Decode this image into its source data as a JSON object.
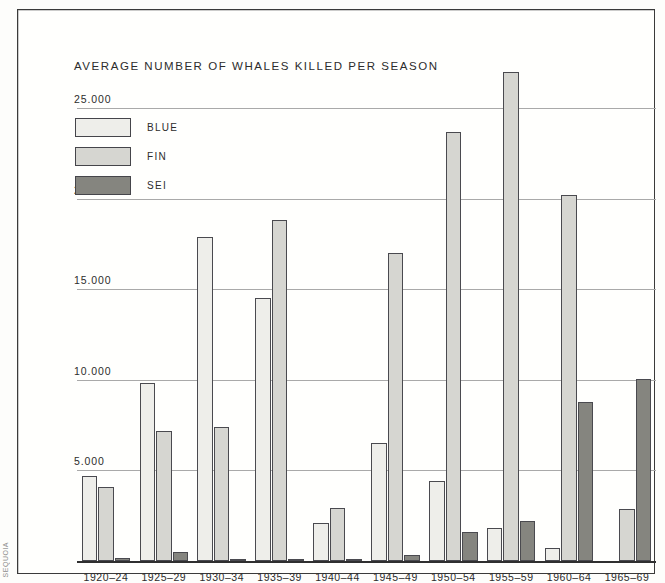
{
  "figure": {
    "title": "AVERAGE NUMBER OF WHALES KILLED PER SEASON",
    "spine_caption": "SEQUOIA"
  },
  "colors": {
    "blue": "#eeeeea",
    "fin": "#d6d6d1",
    "sei": "#85857f",
    "bar_outline": "#4a4a4f",
    "gridline": "#a9a9a9",
    "axis": "#2f2f2f",
    "text": "#2c2c2c"
  },
  "legend": {
    "position": "top-left",
    "items": [
      {
        "label": "BLUE",
        "key": "blue"
      },
      {
        "label": "FIN",
        "key": "fin"
      },
      {
        "label": "SEI",
        "key": "sei"
      }
    ]
  },
  "axis": {
    "ytick_labels": [
      "25.000",
      "20.000",
      "15.000",
      "10.000",
      "5.000"
    ],
    "ytick_values": [
      25000,
      20000,
      15000,
      10000,
      5000
    ]
  },
  "chart_data": {
    "type": "bar",
    "title": "AVERAGE NUMBER OF WHALES KILLED PER SEASON",
    "xlabel": "",
    "ylabel": "",
    "ylim": [
      0,
      28200
    ],
    "grid": true,
    "legend_position": "top-left",
    "categories": [
      "1920–24",
      "1925–29",
      "1930–34",
      "1935–39",
      "1940–44",
      "1945–49",
      "1950–54",
      "1955–59",
      "1960–64",
      "1965–69"
    ],
    "series": [
      {
        "name": "BLUE",
        "color": "#eeeeea",
        "values": [
          4700,
          9850,
          17900,
          14500,
          2100,
          6500,
          4400,
          1800,
          700,
          0
        ]
      },
      {
        "name": "FIN",
        "color": "#d6d6d1",
        "values": [
          4100,
          7200,
          7400,
          18800,
          2950,
          17000,
          23700,
          27000,
          20200,
          2900
        ]
      },
      {
        "name": "SEI",
        "color": "#85857f",
        "values": [
          150,
          500,
          120,
          120,
          60,
          350,
          1600,
          2200,
          8800,
          10050
        ]
      }
    ]
  }
}
